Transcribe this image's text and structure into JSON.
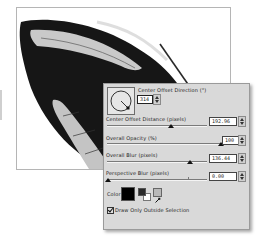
{
  "canvas": {
    "subject": "butterfly wing grayscale image"
  },
  "panel": {
    "direction": {
      "label": "Center Offset Direction (°)",
      "value": "314"
    },
    "sliders": [
      {
        "label": "Center Offset Distance (pixels)",
        "value": "192.96",
        "thumb_pct": 64
      },
      {
        "label": "Overall Opacity (%)",
        "value": "100",
        "thumb_pct": 100
      },
      {
        "label": "Overall Blur (pixels)",
        "value": "136.44",
        "thumb_pct": 83
      },
      {
        "label": "Perspective Blur (pixels)",
        "value": "0.00",
        "thumb_pct": 0
      }
    ],
    "color": {
      "label": "Color",
      "swatch": "#000000",
      "foreground": "#2a2a2a",
      "background": "#ffffff"
    },
    "checkbox": {
      "label": "Draw Only Outside Selection",
      "checked": true
    }
  }
}
